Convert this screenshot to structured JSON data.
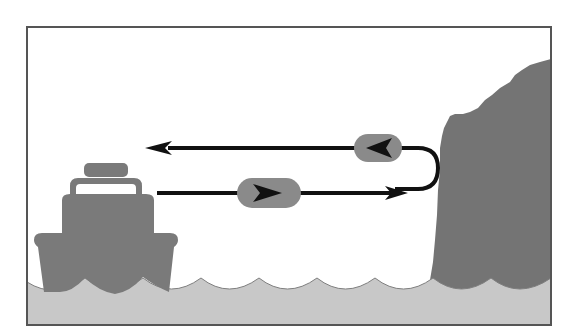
{
  "diagram": {
    "colors": {
      "background": "#ffffff",
      "frame": "#555555",
      "water": "#c8c8c8",
      "boat": "#7a7a7a",
      "cliff": "#747474",
      "pill": "#8a8a8a",
      "arrow": "#111111"
    },
    "elements": {
      "boat": "boat-icon",
      "cliff": "cliff-icon",
      "water": "water-waves",
      "outgoing_signal": {
        "direction": "right",
        "marker": "right-chevron"
      },
      "returning_signal": {
        "direction": "left",
        "marker": "left-chevron"
      }
    }
  }
}
